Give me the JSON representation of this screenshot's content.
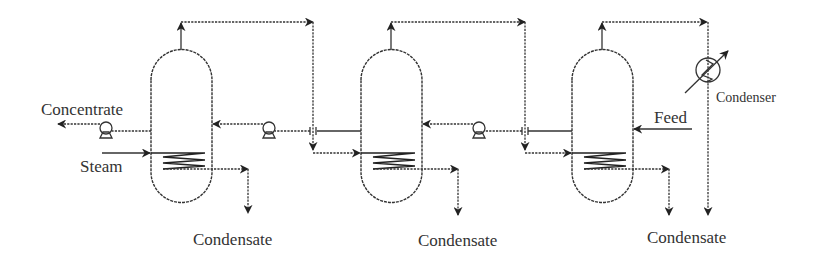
{
  "diagram": {
    "colors": {
      "line": "#333333",
      "background": "#ffffff"
    },
    "labels": {
      "concentrate": "Concentrate",
      "steam": "Steam",
      "feed": "Feed",
      "condenser": "Condenser",
      "condensate_1": "Condensate",
      "condensate_2": "Condensate",
      "condensate_3": "Condensate"
    },
    "effects": [
      {
        "name": "effect-1",
        "vessel_x": 151,
        "heating": "steam"
      },
      {
        "name": "effect-2",
        "vessel_x": 361,
        "heating": "vapor from effect 1"
      },
      {
        "name": "effect-3",
        "vessel_x": 572,
        "heating": "vapor from effect 2"
      }
    ],
    "equipment": {
      "pumps": 3,
      "condensers": 1,
      "vessels": 3
    }
  }
}
